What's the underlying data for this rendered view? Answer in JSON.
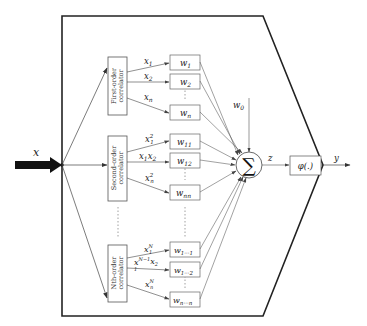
{
  "diagram": {
    "input_label": "x",
    "output_label": "y",
    "sum_output_label": "z",
    "bias_label": "w0",
    "sum_symbol": "∑",
    "activation_label": "φ(.)",
    "correlators": [
      {
        "name": "First-order correlator",
        "line1": "First-order",
        "line2": "correlator",
        "outputs": [
          {
            "label": "x1",
            "weight": "w1"
          },
          {
            "label": "x2",
            "weight": "w2"
          },
          {
            "label": "xn",
            "weight": "wn"
          }
        ]
      },
      {
        "name": "Second-order correlator",
        "line1": "Second-order",
        "line2": "correlator",
        "outputs": [
          {
            "label": "x1²",
            "weight": "w11"
          },
          {
            "label": "x1x2",
            "weight": "w12"
          },
          {
            "label": "xn²",
            "weight": "wnn"
          }
        ]
      },
      {
        "name": "Nth-order correlator",
        "line1": "Nth-order",
        "line2": "correlator",
        "outputs": [
          {
            "label": "x1^N",
            "weight": "w1…1"
          },
          {
            "label": "x1^(N−1)x2",
            "weight": "w1…2"
          },
          {
            "label": "xn^N",
            "weight": "wn…n"
          }
        ]
      }
    ],
    "ellipsis": "⋮"
  }
}
